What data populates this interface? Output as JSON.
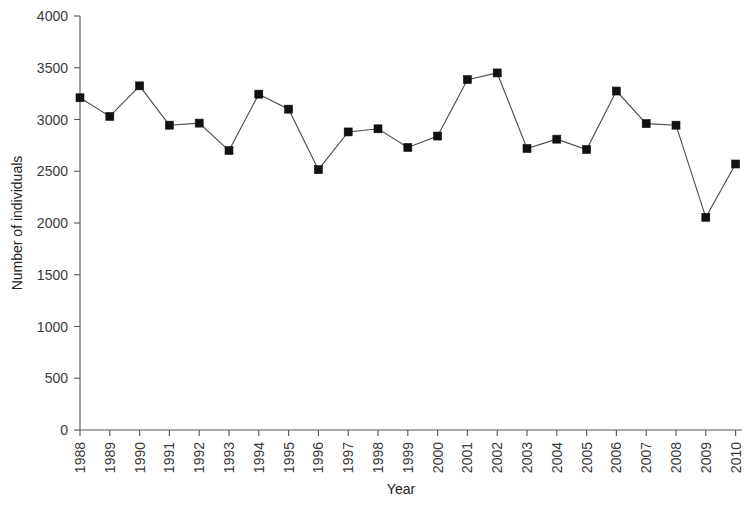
{
  "chart_data": {
    "type": "line",
    "title": "",
    "xlabel": "Year",
    "ylabel": "Number of individuals",
    "categories": [
      "1988",
      "1989",
      "1990",
      "1991",
      "1992",
      "1993",
      "1994",
      "1995",
      "1996",
      "1997",
      "1998",
      "1999",
      "2000",
      "2001",
      "2002",
      "2003",
      "2004",
      "2005",
      "2006",
      "2007",
      "2008",
      "2009",
      "2010"
    ],
    "values": [
      3210,
      3030,
      3325,
      2945,
      2965,
      2700,
      3245,
      3100,
      2515,
      2880,
      2910,
      2730,
      2840,
      3385,
      3450,
      2720,
      2810,
      2710,
      3275,
      2960,
      2945,
      2055,
      2570
    ],
    "series": [
      {
        "name": "Number of individuals",
        "values": [
          3210,
          3030,
          3325,
          2945,
          2965,
          2700,
          3245,
          3100,
          2515,
          2880,
          2910,
          2730,
          2840,
          3385,
          3450,
          2720,
          2810,
          2710,
          3275,
          2960,
          2945,
          2055,
          2570
        ]
      }
    ],
    "ylim": [
      0,
      4000
    ],
    "y_ticks": [
      0,
      500,
      1000,
      1500,
      2000,
      2500,
      3000,
      3500,
      4000
    ],
    "y_tick_labels": [
      "0",
      "500",
      "1000",
      "1500",
      "2000",
      "2500",
      "3000",
      "3500",
      "4000"
    ],
    "x_tick_labels": [
      "1988",
      "1989",
      "1990",
      "1991",
      "1992",
      "1993",
      "1994",
      "1995",
      "1996",
      "1997",
      "1998",
      "1999",
      "2000",
      "2001",
      "2002",
      "2003",
      "2004",
      "2005",
      "2006",
      "2007",
      "2008",
      "2009",
      "2010"
    ],
    "grid": false,
    "legend": false,
    "legend_position": "none",
    "marker": "square",
    "line_color": "#4a4a4a",
    "marker_color": "#111111",
    "x_tick_label_rotation": -90
  },
  "axis": {
    "x_title": "Year",
    "y_title": "Number of individuals"
  }
}
